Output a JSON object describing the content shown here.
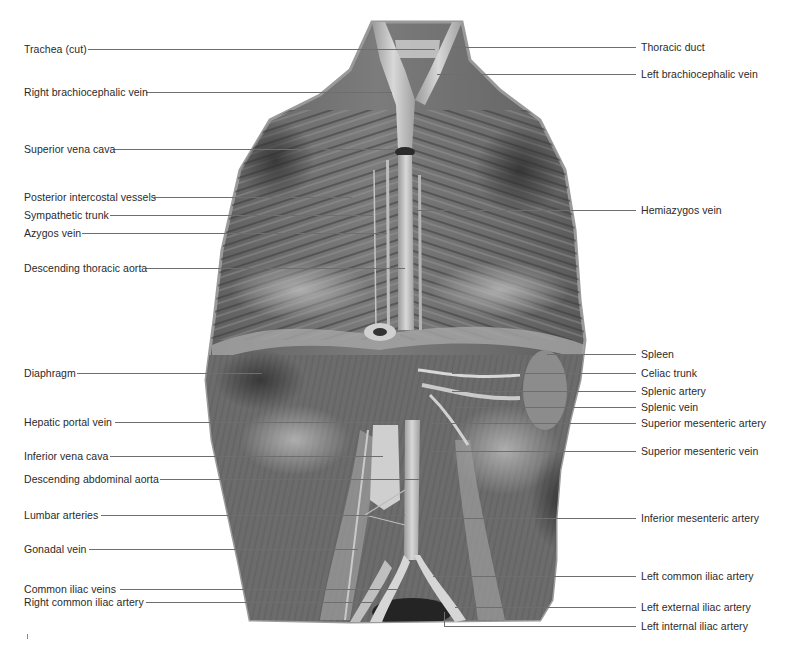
{
  "figure": {
    "image_style": "grayscale anatomical dissection photograph",
    "colors": {
      "background": "#ffffff",
      "label_text": "#2a2a2a",
      "leader_line": "#6e6e6e",
      "specimen_dark": "#4a4a4a",
      "specimen_mid": "#7a7a7a",
      "specimen_light": "#c8c8c8"
    }
  },
  "labels_left": [
    {
      "text": "Trachea (cut)",
      "x": 24,
      "y": 43,
      "line_y": 49,
      "line_x1": 88,
      "line_x2": 435
    },
    {
      "text": "Right brachiocephalic vein",
      "x": 24,
      "y": 86,
      "line_y": 92,
      "line_x1": 146,
      "line_x2": 392
    },
    {
      "text": "Superior vena cava",
      "x": 24,
      "y": 143,
      "line_y": 149,
      "line_x1": 113,
      "line_x2": 395
    },
    {
      "text": "Posterior intercostal vessels",
      "x": 24,
      "y": 191,
      "line_y": 197,
      "line_x1": 154,
      "line_x2": 352
    },
    {
      "text": "Sympathetic trunk",
      "x": 24,
      "y": 209,
      "line_y": 215,
      "line_x1": 110,
      "line_x2": 373
    },
    {
      "text": "Azygos vein",
      "x": 24,
      "y": 227,
      "line_y": 233,
      "line_x1": 82,
      "line_x2": 387
    },
    {
      "text": "Descending thoracic aorta",
      "x": 24,
      "y": 262,
      "line_y": 268,
      "line_x1": 146,
      "line_x2": 405
    },
    {
      "text": "Diaphragm",
      "x": 24,
      "y": 367,
      "line_y": 373,
      "line_x1": 77,
      "line_x2": 262
    },
    {
      "text": "Hepatic portal vein",
      "x": 24,
      "y": 416,
      "line_y": 422,
      "line_x1": 115,
      "line_x2": 402
    },
    {
      "text": "Inferior vena cava",
      "x": 24,
      "y": 450,
      "line_y": 456,
      "line_x1": 110,
      "line_x2": 383
    },
    {
      "text": "Descending abdominal aorta",
      "x": 24,
      "y": 473,
      "line_y": 479,
      "line_x1": 160,
      "line_x2": 420
    },
    {
      "text": "Lumbar arteries",
      "x": 24,
      "y": 509,
      "line_y": 515,
      "line_x1": 101,
      "line_x2": 405
    },
    {
      "text": "Gonadal vein",
      "x": 24,
      "y": 543,
      "line_y": 549,
      "line_x1": 89,
      "line_x2": 358
    },
    {
      "text": "Common iliac veins",
      "x": 24,
      "y": 583,
      "line_y": 589,
      "line_x1": 120,
      "line_x2": 412
    },
    {
      "text": "Right common iliac artery",
      "x": 24,
      "y": 596,
      "line_y": 602,
      "line_x1": 146,
      "line_x2": 375
    }
  ],
  "labels_right": [
    {
      "text": "Thoracic duct",
      "x": 641,
      "y": 41,
      "line_y": 47,
      "line_x1": 452,
      "line_x2": 636
    },
    {
      "text": "Left brachiocephalic vein",
      "x": 641,
      "y": 68,
      "line_y": 74,
      "line_x1": 437,
      "line_x2": 636
    },
    {
      "text": "Hemiazygos vein",
      "x": 641,
      "y": 204,
      "line_y": 210,
      "line_x1": 415,
      "line_x2": 636
    },
    {
      "text": "Spleen",
      "x": 641,
      "y": 348,
      "line_y": 354,
      "line_x1": 547,
      "line_x2": 636
    },
    {
      "text": "Celiac trunk",
      "x": 641,
      "y": 367,
      "line_y": 373,
      "line_x1": 452,
      "line_x2": 636
    },
    {
      "text": "Splenic artery",
      "x": 641,
      "y": 385,
      "line_y": 391,
      "line_x1": 452,
      "line_x2": 636
    },
    {
      "text": "Splenic vein",
      "x": 641,
      "y": 401,
      "line_y": 407,
      "line_x1": 452,
      "line_x2": 636
    },
    {
      "text": "Superior mesenteric artery",
      "x": 641,
      "y": 417,
      "line_y": 423,
      "line_x1": 432,
      "line_x2": 636
    },
    {
      "text": "Superior mesenteric vein",
      "x": 641,
      "y": 445,
      "line_y": 451,
      "line_x1": 432,
      "line_x2": 636
    },
    {
      "text": "Inferior mesenteric artery",
      "x": 641,
      "y": 512,
      "line_y": 518,
      "line_x1": 428,
      "line_x2": 636
    },
    {
      "text": "Left common iliac artery",
      "x": 641,
      "y": 570,
      "line_y": 576,
      "line_x1": 433,
      "line_x2": 636
    },
    {
      "text": "Left external iliac artery",
      "x": 641,
      "y": 601,
      "line_y": 607,
      "line_x1": 455,
      "line_x2": 636
    },
    {
      "text": "Left internal iliac artery",
      "x": 641,
      "y": 620,
      "line_y": 626,
      "line_x1": 444,
      "line_x2": 636,
      "drop_from_y": 612
    }
  ]
}
